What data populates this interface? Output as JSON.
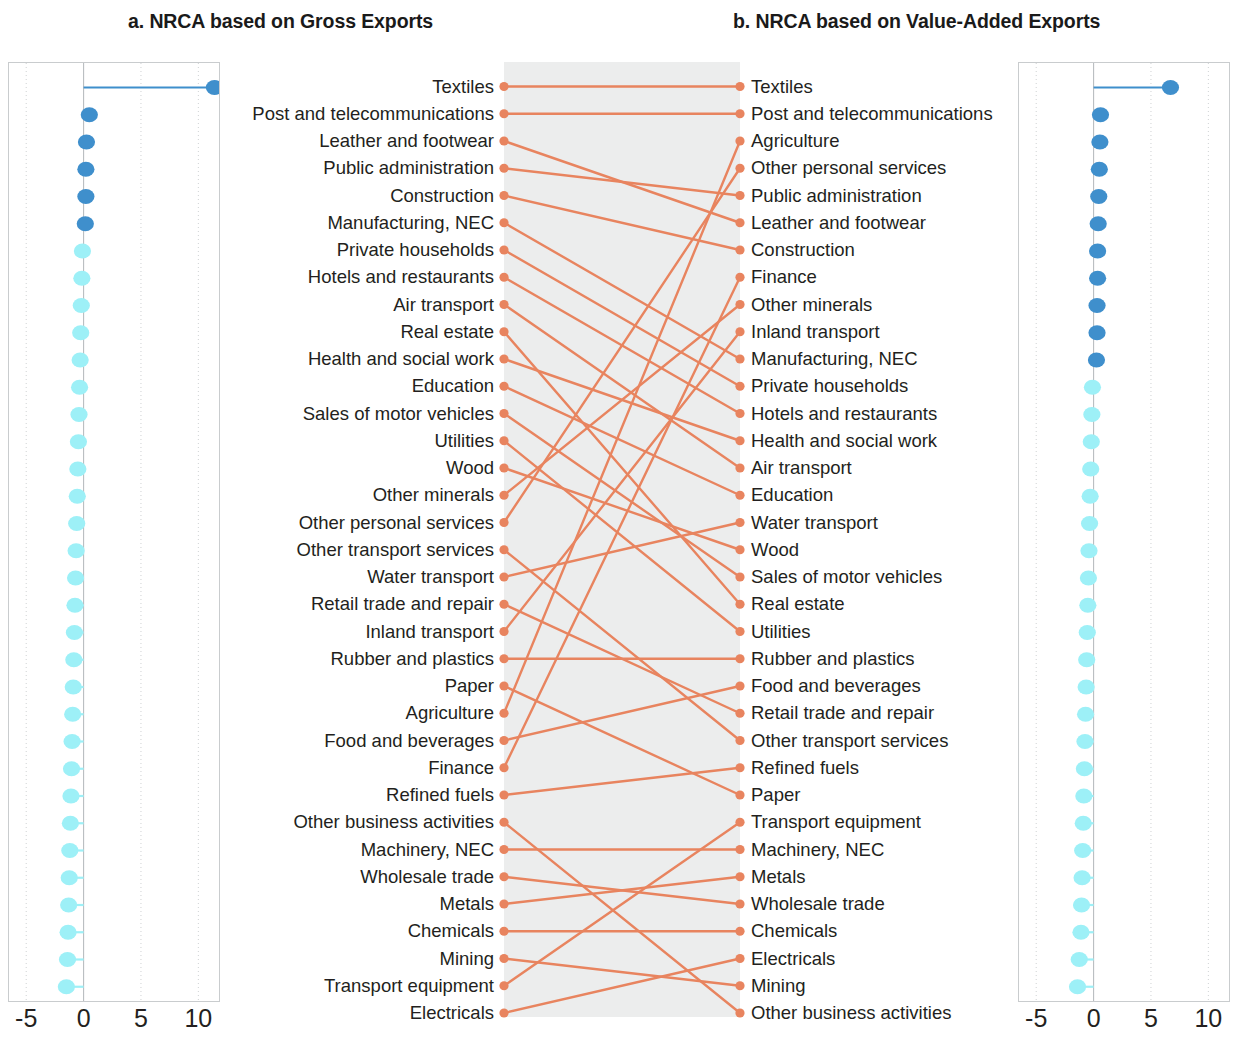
{
  "figure": {
    "panel_a_title": "a. NRCA based on Gross Exports",
    "panel_b_title": "b. NRCA based on Value-Added Exports"
  },
  "colors": {
    "positive_dot": "#3f8fcc",
    "negative_dot": "#9df0f7",
    "link": "#e8845f",
    "band": "#eceded",
    "gridline": "#cfd2d4",
    "zeroline": "#b9bdc0",
    "panel_border": "#c9ccce",
    "text": "#231f20"
  },
  "axis": {
    "ticks": [
      "-5",
      "0",
      "5",
      "10"
    ],
    "tick_values": [
      -5,
      0,
      5,
      10
    ],
    "xmin": -6.5,
    "xmax": 11.8
  },
  "chart_data": {
    "type": "scatter",
    "subtitle": "",
    "xlabel": "NRCA",
    "ylabel": "",
    "xlim": [
      -6.5,
      11.8
    ],
    "grid": true,
    "legend": "none",
    "panels": [
      {
        "key": "a",
        "title": "a. NRCA based on Gross Exports",
        "categories": [
          "Textiles",
          "Post and telecommunications",
          "Leather and footwear",
          "Public administration",
          "Construction",
          "Manufacturing, NEC",
          "Private households",
          "Hotels and restaurants",
          "Air transport",
          "Real estate",
          "Health and social work",
          "Education",
          "Sales of motor vehicles",
          "Utilities",
          "Wood",
          "Other minerals",
          "Other personal services",
          "Other transport services",
          "Water transport",
          "Retail trade and repair",
          "Inland transport",
          "Rubber and plastics",
          "Paper",
          "Agriculture",
          "Food and beverages",
          "Finance",
          "Refined fuels",
          "Other business activities",
          "Machinery, NEC",
          "Wholesale trade",
          "Metals",
          "Chemicals",
          "Mining",
          "Transport equipment",
          "Electricals"
        ],
        "values": [
          11.4,
          0.5,
          0.25,
          0.2,
          0.2,
          0.15,
          -0.1,
          -0.15,
          -0.2,
          -0.25,
          -0.3,
          -0.35,
          -0.4,
          -0.45,
          -0.5,
          -0.55,
          -0.6,
          -0.65,
          -0.7,
          -0.75,
          -0.8,
          -0.85,
          -0.9,
          -0.95,
          -1.0,
          -1.05,
          -1.1,
          -1.15,
          -1.2,
          -1.25,
          -1.3,
          -1.35,
          -1.4,
          -1.5,
          -2.0
        ]
      },
      {
        "key": "b",
        "title": "b. NRCA based on Value-Added Exports",
        "categories": [
          "Textiles",
          "Post and telecommunications",
          "Agriculture",
          "Other personal services",
          "Public administration",
          "Leather and footwear",
          "Construction",
          "Finance",
          "Other minerals",
          "Inland transport",
          "Manufacturing, NEC",
          "Private households",
          "Hotels and restaurants",
          "Health and social work",
          "Air transport",
          "Education",
          "Water transport",
          "Wood",
          "Sales of motor vehicles",
          "Real estate",
          "Utilities",
          "Rubber and plastics",
          "Food and beverages",
          "Retail trade and repair",
          "Other transport services",
          "Refined fuels",
          "Paper",
          "Transport equipment",
          "Machinery, NEC",
          "Metals",
          "Wholesale trade",
          "Chemicals",
          "Electricals",
          "Mining",
          "Other business activities"
        ],
        "values": [
          6.7,
          0.6,
          0.55,
          0.5,
          0.45,
          0.4,
          0.35,
          0.35,
          0.3,
          0.3,
          0.25,
          -0.1,
          -0.15,
          -0.2,
          -0.25,
          -0.3,
          -0.35,
          -0.4,
          -0.45,
          -0.5,
          -0.55,
          -0.6,
          -0.65,
          -0.7,
          -0.75,
          -0.8,
          -0.85,
          -0.9,
          -0.95,
          -1.0,
          -1.05,
          -1.1,
          -1.25,
          -1.4,
          -1.9
        ]
      }
    ],
    "links": [
      {
        "left": "Textiles",
        "right": "Textiles"
      },
      {
        "left": "Post and telecommunications",
        "right": "Post and telecommunications"
      },
      {
        "left": "Leather and footwear",
        "right": "Leather and footwear"
      },
      {
        "left": "Public administration",
        "right": "Public administration"
      },
      {
        "left": "Construction",
        "right": "Construction"
      },
      {
        "left": "Manufacturing, NEC",
        "right": "Manufacturing, NEC"
      },
      {
        "left": "Private households",
        "right": "Private households"
      },
      {
        "left": "Hotels and restaurants",
        "right": "Hotels and restaurants"
      },
      {
        "left": "Air transport",
        "right": "Air transport"
      },
      {
        "left": "Real estate",
        "right": "Real estate"
      },
      {
        "left": "Health and social work",
        "right": "Health and social work"
      },
      {
        "left": "Education",
        "right": "Education"
      },
      {
        "left": "Sales of motor vehicles",
        "right": "Sales of motor vehicles"
      },
      {
        "left": "Utilities",
        "right": "Utilities"
      },
      {
        "left": "Wood",
        "right": "Wood"
      },
      {
        "left": "Other minerals",
        "right": "Other minerals"
      },
      {
        "left": "Other personal services",
        "right": "Other personal services"
      },
      {
        "left": "Other transport services",
        "right": "Other transport services"
      },
      {
        "left": "Water transport",
        "right": "Water transport"
      },
      {
        "left": "Retail trade and repair",
        "right": "Retail trade and repair"
      },
      {
        "left": "Inland transport",
        "right": "Inland transport"
      },
      {
        "left": "Rubber and plastics",
        "right": "Rubber and plastics"
      },
      {
        "left": "Paper",
        "right": "Paper"
      },
      {
        "left": "Agriculture",
        "right": "Agriculture"
      },
      {
        "left": "Food and beverages",
        "right": "Food and beverages"
      },
      {
        "left": "Finance",
        "right": "Finance"
      },
      {
        "left": "Refined fuels",
        "right": "Refined fuels"
      },
      {
        "left": "Other business activities",
        "right": "Other business activities"
      },
      {
        "left": "Machinery, NEC",
        "right": "Machinery, NEC"
      },
      {
        "left": "Wholesale trade",
        "right": "Wholesale trade"
      },
      {
        "left": "Metals",
        "right": "Metals"
      },
      {
        "left": "Chemicals",
        "right": "Chemicals"
      },
      {
        "left": "Mining",
        "right": "Mining"
      },
      {
        "left": "Transport equipment",
        "right": "Transport equipment"
      },
      {
        "left": "Electricals",
        "right": "Electricals"
      }
    ]
  }
}
